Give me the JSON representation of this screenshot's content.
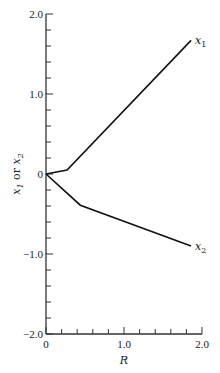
{
  "chart_data": {
    "type": "line",
    "title": "",
    "xlabel": "R",
    "ylabel": "x1 or x2",
    "xlim": [
      0,
      2.0
    ],
    "ylim": [
      -2.0,
      2.0
    ],
    "x_ticks": [
      0,
      1.0,
      2.0
    ],
    "x_tick_labels": [
      "0",
      "1.0",
      "2.0"
    ],
    "x_minor_step": 0.2,
    "y_ticks": [
      2.0,
      1.0,
      0,
      -1.0,
      -2.0
    ],
    "y_tick_labels": [
      "2.0",
      "1.0",
      "0",
      "−1.0",
      "−2.0"
    ],
    "y_minor_step": 0.2,
    "grid": false,
    "legend": "inline labels at line ends",
    "series": [
      {
        "name": "x1",
        "label": "x₁",
        "x": [
          0,
          0.27,
          1.86
        ],
        "y": [
          0,
          0.05,
          1.67
        ]
      },
      {
        "name": "x2",
        "label": "x₂",
        "x": [
          0,
          0.44,
          1.86
        ],
        "y": [
          0,
          -0.39,
          -0.9
        ]
      }
    ]
  },
  "layout": {
    "origin_px": [
      46,
      174
    ],
    "x_px_per_unit": 78,
    "y_px_per_unit": 80,
    "line_color": "#111111"
  }
}
